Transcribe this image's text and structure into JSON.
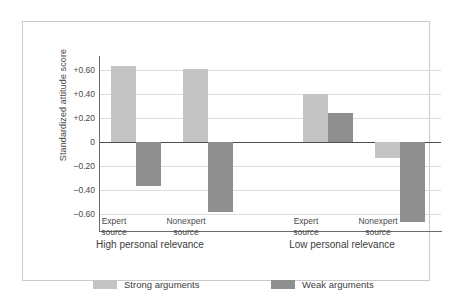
{
  "chart_data": {
    "type": "bar",
    "title": "",
    "subtitle": "",
    "xlabel": "",
    "ylabel": "Standardized attitude score",
    "ylim": [
      -0.7,
      0.7
    ],
    "yticks": [
      "+0.60",
      "+0.40",
      "+0.20",
      "0",
      "–0.20",
      "–0.40",
      "–0.60"
    ],
    "ytick_values": [
      0.6,
      0.4,
      0.2,
      0,
      -0.2,
      -0.4,
      -0.6
    ],
    "grid": true,
    "legend_position": "bottom-left",
    "categories": [
      "Expert source",
      "Nonexpert source",
      "Expert source",
      "Nonexpert source"
    ],
    "category_lines": [
      [
        "Expert",
        "source"
      ],
      [
        "Nonexpert",
        "source"
      ],
      [
        "Expert",
        "source"
      ],
      [
        "Nonexpert",
        "source"
      ]
    ],
    "groups": [
      {
        "label": "High personal relevance",
        "categories": [
          0,
          1
        ]
      },
      {
        "label": "Low personal relevance",
        "categories": [
          2,
          3
        ]
      }
    ],
    "series": [
      {
        "name": "Strong arguments",
        "color": "#c4c4c4",
        "values": [
          0.63,
          0.61,
          0.4,
          -0.13
        ]
      },
      {
        "name": "Weak arguments",
        "color": "#8f8f8f",
        "values": [
          -0.37,
          -0.58,
          0.24,
          -0.67
        ]
      }
    ]
  },
  "legend": {
    "items": [
      {
        "label": "Strong arguments",
        "swatch": "strong"
      },
      {
        "label": "Weak arguments",
        "swatch": "weak"
      }
    ]
  },
  "colors": {
    "strong": "#c4c4c4",
    "weak": "#8f8f8f",
    "axis": "#6b6b6b",
    "grid": "#dcdcdc",
    "frame": "#c9c9c9",
    "text": "#4a4a4a"
  }
}
